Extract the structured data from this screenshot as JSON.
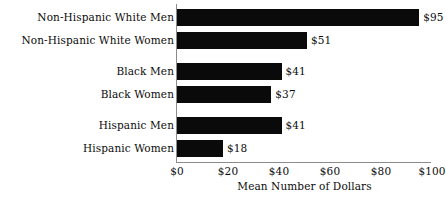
{
  "chart_data": {
    "type": "bar",
    "orientation": "horizontal",
    "title": "",
    "xlabel": "Mean Number of Dollars",
    "ylabel": "",
    "xlim": [
      0,
      100
    ],
    "grid": false,
    "legend": null,
    "categories": [
      "Non-Hispanic White Men",
      "Non-Hispanic White Women",
      "Black Men",
      "Black Women",
      "Hispanic Men",
      "Hispanic Women"
    ],
    "values": [
      95,
      51,
      41,
      37,
      41,
      18
    ],
    "data_labels": [
      "$95",
      "$51",
      "$41",
      "$37",
      "$41",
      "$18"
    ],
    "xticks": [
      0,
      20,
      40,
      60,
      80,
      100
    ],
    "xticklabels": [
      "$0",
      "$20",
      "$40",
      "$60",
      "$80",
      "$100"
    ],
    "bar_color": "#0a0a0a",
    "axis_color": "#8c8c8c",
    "background_color": "#ffffff",
    "groups": [
      {
        "name": "Non-Hispanic White",
        "categories": [
          "Non-Hispanic White Men",
          "Non-Hispanic White Women"
        ]
      },
      {
        "name": "Black",
        "categories": [
          "Black Men",
          "Black Women"
        ]
      },
      {
        "name": "Hispanic",
        "categories": [
          "Hispanic Men",
          "Hispanic Women"
        ]
      }
    ]
  },
  "layout": {
    "bar_tops": [
      9,
      32,
      63,
      86,
      117,
      140
    ],
    "tick_x": [
      0,
      51,
      102,
      153,
      204,
      255
    ]
  }
}
